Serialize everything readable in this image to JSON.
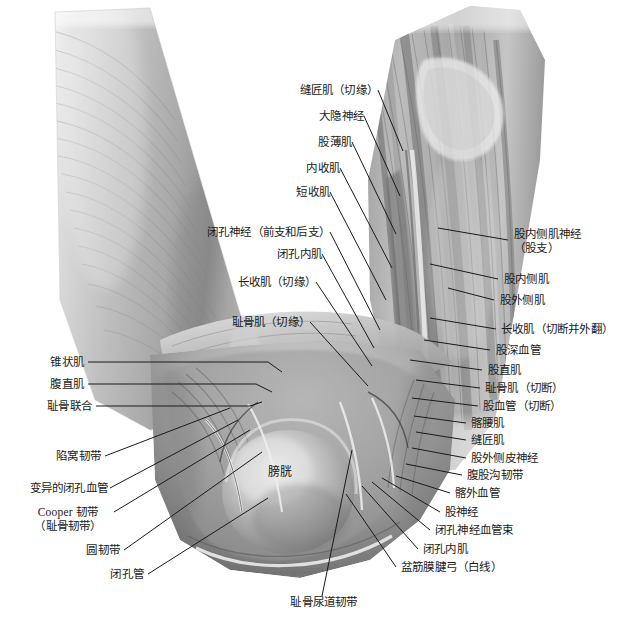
{
  "figure": {
    "type": "anatomical-illustration",
    "style": "grayscale-airbrush-medical-illustration",
    "background_color": "#ffffff",
    "label_color": "#1a1a1a",
    "leader_line_color": "#1a1a1a",
    "width": 620,
    "height": 627
  },
  "labels_top_left": [
    {
      "id": "sartorius-cut-edge",
      "text": "缝匠肌（切缘）"
    },
    {
      "id": "great-saphenous-nerve",
      "text": "大隐神经"
    },
    {
      "id": "gracilis",
      "text": "股薄肌"
    },
    {
      "id": "adductor-magnus",
      "text": "内收肌"
    },
    {
      "id": "adductor-brevis",
      "text": "短收肌"
    },
    {
      "id": "obturator-nerve-branches",
      "text": "闭孔神经（前支和后支）"
    },
    {
      "id": "obturator-internus",
      "text": "闭孔内肌"
    },
    {
      "id": "adductor-longus-cut-edge",
      "text": "长收肌（切缘）"
    },
    {
      "id": "pectineus-cut-edge",
      "text": "耻骨肌（切缘）"
    }
  ],
  "labels_left": [
    {
      "id": "pyramidalis",
      "text": "锥状肌"
    },
    {
      "id": "rectus-abdominis",
      "text": "腹直肌"
    },
    {
      "id": "pubic-symphysis",
      "text": "耻骨联合"
    },
    {
      "id": "lacunar-ligament",
      "text": "陷窝韧带"
    },
    {
      "id": "aberrant-obturator-vessels",
      "text": "变异的闭孔血管"
    },
    {
      "id": "cooper-ligament",
      "text": "Cooper 韧带",
      "line2": "（耻骨韧带）"
    },
    {
      "id": "round-ligament",
      "text": "圆韧带"
    },
    {
      "id": "obturator-canal",
      "text": "闭孔管"
    }
  ],
  "labels_right": [
    {
      "id": "nerve-to-vastus-medialis",
      "text": "股内侧肌神经",
      "line2": "（股支）"
    },
    {
      "id": "vastus-medialis",
      "text": "股内侧肌"
    },
    {
      "id": "vastus-lateralis",
      "text": "股外侧肌"
    },
    {
      "id": "adductor-longus-cut-reflected",
      "text": "长收肌（切断并外翻）"
    },
    {
      "id": "deep-femoral-vessels",
      "text": "股深血管"
    },
    {
      "id": "rectus-femoris",
      "text": "股直肌"
    },
    {
      "id": "pectineus-cut",
      "text": "耻骨肌（切断）"
    },
    {
      "id": "femoral-vessels-cut",
      "text": "股血管（切断）"
    },
    {
      "id": "iliopsoas",
      "text": "髂腰肌"
    },
    {
      "id": "sartorius",
      "text": "缝匠肌"
    },
    {
      "id": "lateral-femoral-cutaneous-nerve",
      "text": "股外侧皮神经"
    },
    {
      "id": "inguinal-ligament",
      "text": "腹股沟韧带"
    },
    {
      "id": "external-iliac-vessels",
      "text": "髂外血管"
    },
    {
      "id": "femoral-nerve",
      "text": "股神经"
    },
    {
      "id": "obturator-neurovascular-bundle",
      "text": "闭孔神经血管束"
    },
    {
      "id": "obturator-internus-right",
      "text": "闭孔内肌"
    },
    {
      "id": "tendinous-arch-pelvic-fascia",
      "text": "盆筋膜腱弓（白线）"
    }
  ],
  "labels_bottom": [
    {
      "id": "pubourethral-ligament",
      "text": "耻骨尿道韧带"
    }
  ],
  "labels_in_body": [
    {
      "id": "bladder",
      "text": "膀胱"
    }
  ]
}
